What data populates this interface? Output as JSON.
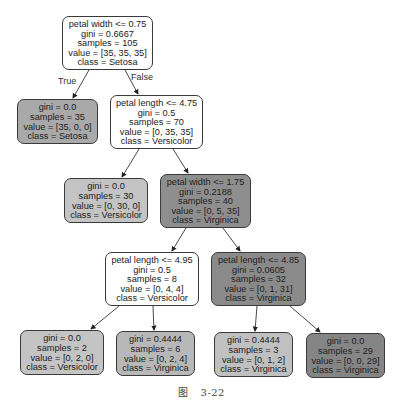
{
  "diagram": {
    "type": "decision-tree",
    "colors": {
      "white": "#ffffff",
      "light": "#c6c6c6",
      "mid": "#b2b2b2",
      "dark": "#8a8a8a",
      "border": "#3a3a3a"
    },
    "edge_labels": {
      "true": "True",
      "false": "False"
    },
    "nodes": {
      "root": {
        "l1": "petal width <= 0.75",
        "l2": "gini = 0.6667",
        "l3": "samples = 105",
        "l4": "value = [35, 35, 35]",
        "l5": "class = Setosa"
      },
      "n1": {
        "l2": "gini = 0.0",
        "l3": "samples = 35",
        "l4": "value = [35, 0, 0]",
        "l5": "class = Setosa"
      },
      "n2": {
        "l1": "petal length <= 4.75",
        "l2": "gini = 0.5",
        "l3": "samples = 70",
        "l4": "value = [0, 35, 35]",
        "l5": "class = Versicolor"
      },
      "n3": {
        "l2": "gini = 0.0",
        "l3": "samples = 30",
        "l4": "value = [0, 30, 0]",
        "l5": "class = Versicolor"
      },
      "n4": {
        "l1": "petal width <= 1.75",
        "l2": "gini = 0.2188",
        "l3": "samples = 40",
        "l4": "value = [0, 5, 35]",
        "l5": "class = Virginica"
      },
      "n5": {
        "l1": "petal length <= 4.95",
        "l2": "gini = 0.5",
        "l3": "samples = 8",
        "l4": "value = [0, 4, 4]",
        "l5": "class = Versicolor"
      },
      "n6": {
        "l1": "petal length <= 4.85",
        "l2": "gini = 0.0605",
        "l3": "samples = 32",
        "l4": "value = [0, 1, 31]",
        "l5": "class = Virginica"
      },
      "n7": {
        "l2": "gini = 0.0",
        "l3": "samples = 2",
        "l4": "value = [0, 2, 0]",
        "l5": "class = Versicolor"
      },
      "n8": {
        "l2": "gini = 0.4444",
        "l3": "samples = 6",
        "l4": "value = [0, 2, 4]",
        "l5": "class = Virginica"
      },
      "n9": {
        "l2": "gini = 0.4444",
        "l3": "samples = 3",
        "l4": "value = [0, 1, 2]",
        "l5": "class = Virginica"
      },
      "n10": {
        "l2": "gini = 0.0",
        "l3": "samples = 29",
        "l4": "value = [0, 0, 29]",
        "l5": "class = Virginica"
      }
    }
  },
  "caption": {
    "figure": "图",
    "number": "3-22"
  }
}
